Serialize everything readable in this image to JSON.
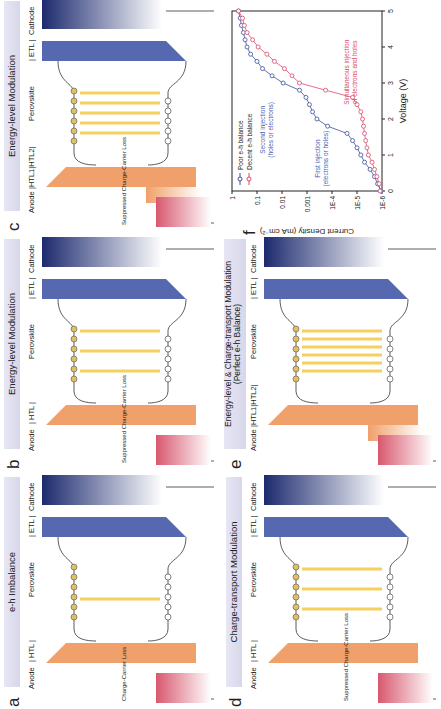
{
  "figure": {
    "panels": [
      {
        "id": "a",
        "letter": "a",
        "title": "e-h Imbalance",
        "labels": {
          "anode": "Anode",
          "htl": "| HTL |",
          "perovskite": "Perovskite",
          "etl": "| ETL |",
          "cathode": "Cathode"
        },
        "annotation": "Charge-Carrier Loss",
        "emission_lines": 1,
        "htl_type": "single"
      },
      {
        "id": "b",
        "letter": "b",
        "title": "Energy-level Modulation",
        "labels": {
          "anode": "Anode",
          "htl": "| HTL |",
          "perovskite": "Perovskite",
          "etl": "| ETL |",
          "cathode": "Cathode"
        },
        "annotation": "Suppressed Charge-Carrier Loss",
        "emission_lines": 3,
        "htl_type": "single"
      },
      {
        "id": "c",
        "letter": "c",
        "title": "Energy-level Modulation",
        "labels": {
          "anode": "Anode",
          "htl": "|HTL1|HTL2|",
          "perovskite": "Perovskite",
          "etl": "| ETL |",
          "cathode": "Cathode"
        },
        "annotation": "Suppressed Charge-Carrier Loss",
        "emission_lines": 5,
        "htl_type": "double"
      },
      {
        "id": "d",
        "letter": "d",
        "title": "Charge-transport Modulation",
        "labels": {
          "anode": "Anode",
          "htl": "| HTL |",
          "perovskite": "Perovskite",
          "etl": "| ETL |",
          "cathode": "Cathode"
        },
        "annotation": "Suppressed Charge-Carrier Loss",
        "emission_lines": 3,
        "htl_type": "single"
      },
      {
        "id": "e",
        "letter": "e",
        "title": "Energy-level & Charge-transport Modulation",
        "subtitle": "(Perfect e-h Balance)",
        "labels": {
          "anode": "Anode",
          "htl": "|HTL1|HTL2|",
          "perovskite": "Perovskite",
          "etl": "| ETL |",
          "cathode": "Cathode"
        },
        "annotation": "",
        "emission_lines": 6,
        "htl_type": "double"
      }
    ],
    "colors": {
      "header_band": "#dcdcee",
      "cathode_dark": "#1c2a6e",
      "etl": "#5668b0",
      "htl": "#f0a06a",
      "anode": "#d8586e",
      "emission": "#f5c842",
      "electron_fill": "#e0c060",
      "hole_fill": "#ffffff",
      "poor_series": "#3a4f9a",
      "decent_series": "#d94a6a"
    }
  },
  "chart_data": {
    "type": "line",
    "panel_letter": "f",
    "title": "",
    "xlabel": "Voltage (V)",
    "ylabel": "Current Density (mA cm⁻²)",
    "xlim": [
      0,
      5
    ],
    "ylim": [
      1e-06,
      1
    ],
    "yscale": "log",
    "x_ticks": [
      "0",
      "1",
      "2",
      "3",
      "4",
      "5"
    ],
    "y_ticks": [
      "1E-6",
      "1E-5",
      "1E-4",
      "0.001",
      "0.01",
      "0.1",
      "1"
    ],
    "legend_position": "upper left",
    "grid": false,
    "x": [
      0,
      0.2,
      0.4,
      0.6,
      0.8,
      1.0,
      1.2,
      1.4,
      1.6,
      1.8,
      2.0,
      2.2,
      2.4,
      2.6,
      2.8,
      3.0,
      3.2,
      3.4,
      3.6,
      3.8,
      4.0,
      4.2,
      4.4,
      4.6,
      4.8,
      5.0
    ],
    "series": [
      {
        "name": "Poor e-h balance",
        "color": "#3a4f9a",
        "values": [
          1.1e-06,
          1.5e-06,
          2e-06,
          3e-06,
          5e-06,
          7e-06,
          1e-05,
          1.5e-05,
          2.5e-05,
          0.00015,
          0.0004,
          0.0006,
          0.0008,
          0.0011,
          0.002,
          0.009,
          0.025,
          0.06,
          0.1,
          0.18,
          0.25,
          0.3,
          0.35,
          0.42,
          0.47,
          0.55
        ]
      },
      {
        "name": "Decent e-h balance",
        "color": "#d94a6a",
        "values": [
          1.2e-06,
          1.3e-06,
          1.6e-06,
          2e-06,
          2.5e-06,
          3.5e-06,
          4e-06,
          4.5e-06,
          5e-06,
          5.5e-06,
          6e-06,
          7e-06,
          1e-05,
          1.5e-05,
          0.00018,
          0.002,
          0.004,
          0.008,
          0.02,
          0.04,
          0.09,
          0.15,
          0.25,
          0.32,
          0.38,
          0.55
        ]
      }
    ],
    "annotations": [
      {
        "text": [
          "Second injection",
          "(holes or electrons)"
        ],
        "color": "#4a5fb0",
        "x": 1.7,
        "y": 0.05
      },
      {
        "text": [
          "First injection",
          "(electrons or holes)"
        ],
        "color": "#4a5fb0",
        "x": 0.9,
        "y": 0.0003
      },
      {
        "text": [
          "Simultaneous injection",
          "of electrons and holes"
        ],
        "color": "#d94a6a",
        "x": 3.3,
        "y": 2e-05
      }
    ]
  }
}
